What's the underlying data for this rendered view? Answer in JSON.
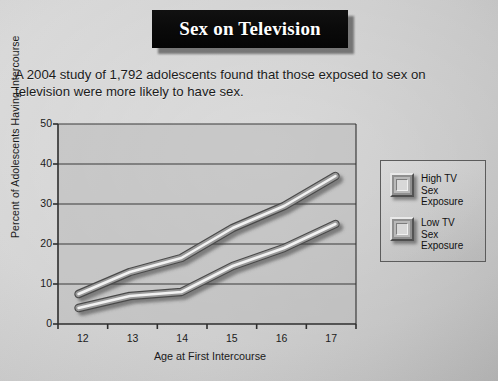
{
  "title": "Sex on Television",
  "subtitle": "A 2004 study of 1,792 adolescents found that those exposed to sex on television were more likely to have sex.",
  "legend": {
    "items": [
      {
        "label_line1": "High TV",
        "label_line2": "Sex",
        "label_line3": "Exposure",
        "swatch": "beveled-square-swatch"
      },
      {
        "label_line1": "Low TV",
        "label_line2": "Sex",
        "label_line3": "Exposure",
        "swatch": "beveled-square-swatch"
      }
    ]
  },
  "colors": {
    "banner_background": "#0a0a0a",
    "banner_text": "#ffffff",
    "page_background": "#c9c9c9",
    "plot_background": "#b9b9b9",
    "axis_line": "#2e2e2e",
    "gridline": "#3a3a3a",
    "line_highlight": "#f2f2f2",
    "line_edge": "#4a4a4a",
    "shadow": "#6d6d6d"
  },
  "chart_data": {
    "type": "line",
    "title": "Sex on Television",
    "xlabel": "Age at First Intercourse",
    "ylabel": "Percent of Adolescents Having Intercourse",
    "x": [
      12,
      13,
      14,
      15,
      16,
      17
    ],
    "xticklabels": [
      "12",
      "13",
      "14",
      "15",
      "16",
      "17"
    ],
    "yticklabels": [
      "0",
      "10",
      "20",
      "30",
      "40",
      "50"
    ],
    "yticks": [
      0,
      10,
      20,
      30,
      40,
      50
    ],
    "ylim": [
      0,
      50
    ],
    "xlim": [
      11.6,
      17.4
    ],
    "grid": true,
    "grid_axis": "y",
    "legend_position": "right",
    "series": [
      {
        "name": "High TV Sex Exposure",
        "values": [
          7.5,
          13,
          16.5,
          24,
          29.5,
          37
        ]
      },
      {
        "name": "Low TV Sex Exposure",
        "values": [
          4,
          7,
          8,
          14.5,
          19,
          25
        ]
      }
    ]
  }
}
